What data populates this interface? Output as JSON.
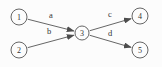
{
  "diagram": {
    "type": "directed-graph",
    "background_color": "#fcfcfc",
    "stroke_color": "#555555",
    "text_color": "#333333",
    "nodes": [
      {
        "id": "1",
        "label": "1",
        "x": 19,
        "y": 17,
        "r": 8
      },
      {
        "id": "2",
        "label": "2",
        "x": 19,
        "y": 50,
        "r": 8
      },
      {
        "id": "3",
        "label": "3",
        "x": 82,
        "y": 33,
        "r": 7
      },
      {
        "id": "4",
        "label": "4",
        "x": 140,
        "y": 16,
        "r": 8
      },
      {
        "id": "5",
        "label": "5",
        "x": 140,
        "y": 50,
        "r": 8
      }
    ],
    "edges": [
      {
        "from": "1",
        "to": "3",
        "label": "a",
        "label_x": 51,
        "label_y": 15
      },
      {
        "from": "2",
        "to": "3",
        "label": "b",
        "label_x": 49,
        "label_y": 31
      },
      {
        "from": "3",
        "to": "4",
        "label": "c",
        "label_x": 110,
        "label_y": 14
      },
      {
        "from": "3",
        "to": "5",
        "label": "d",
        "label_x": 110,
        "label_y": 33
      }
    ]
  }
}
